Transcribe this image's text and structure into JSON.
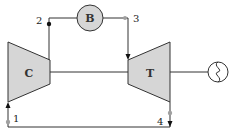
{
  "diagram": {
    "type": "gas-turbine-brayton-cycle",
    "components": {
      "compressor": {
        "label": "C"
      },
      "burner": {
        "label": "B"
      },
      "turbine": {
        "label": "T"
      },
      "generator": {
        "symbol": "generator-icon"
      }
    },
    "state_points": [
      {
        "id": "1",
        "label": "1"
      },
      {
        "id": "2",
        "label": "2"
      },
      {
        "id": "3",
        "label": "3"
      },
      {
        "id": "4",
        "label": "4"
      }
    ],
    "colors": {
      "line": "#333333",
      "component_fill": "#d6d6d6",
      "marker_grey": "#a0a0a0",
      "marker_black": "#111111"
    }
  }
}
